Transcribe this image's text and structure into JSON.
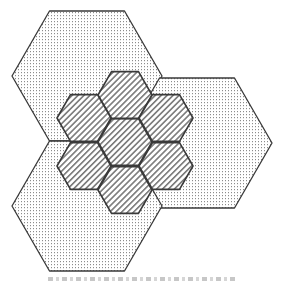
{
  "diagram": {
    "type": "hexagonal-cell-layout",
    "colors": {
      "background": "#ffffff",
      "stroke": "#3a3a3a",
      "dot_fill": "#8c8c8c",
      "hatch_fill": "#7a7a7a"
    },
    "large_cells": [
      {
        "id": "large-top-left",
        "cx": 87,
        "cy": 76,
        "r": 75,
        "pattern": "dots"
      },
      {
        "id": "large-right",
        "cx": 197,
        "cy": 143,
        "r": 75,
        "pattern": "dots"
      },
      {
        "id": "large-bottom-left",
        "cx": 87,
        "cy": 206,
        "r": 75,
        "pattern": "dots"
      }
    ],
    "small_cells": [
      {
        "id": "small-center",
        "cx": 125,
        "cy": 142,
        "r": 27,
        "pattern": "hatch"
      },
      {
        "id": "small-top",
        "cx": 125,
        "cy": 95,
        "r": 27,
        "pattern": "hatch"
      },
      {
        "id": "small-upper-left",
        "cx": 84,
        "cy": 118,
        "r": 27,
        "pattern": "hatch"
      },
      {
        "id": "small-upper-right",
        "cx": 166,
        "cy": 118,
        "r": 27,
        "pattern": "hatch"
      },
      {
        "id": "small-lower-left",
        "cx": 84,
        "cy": 166,
        "r": 27,
        "pattern": "hatch"
      },
      {
        "id": "small-lower-right",
        "cx": 166,
        "cy": 166,
        "r": 27,
        "pattern": "hatch"
      },
      {
        "id": "small-bottom",
        "cx": 125,
        "cy": 190,
        "r": 27,
        "pattern": "hatch"
      }
    ]
  }
}
